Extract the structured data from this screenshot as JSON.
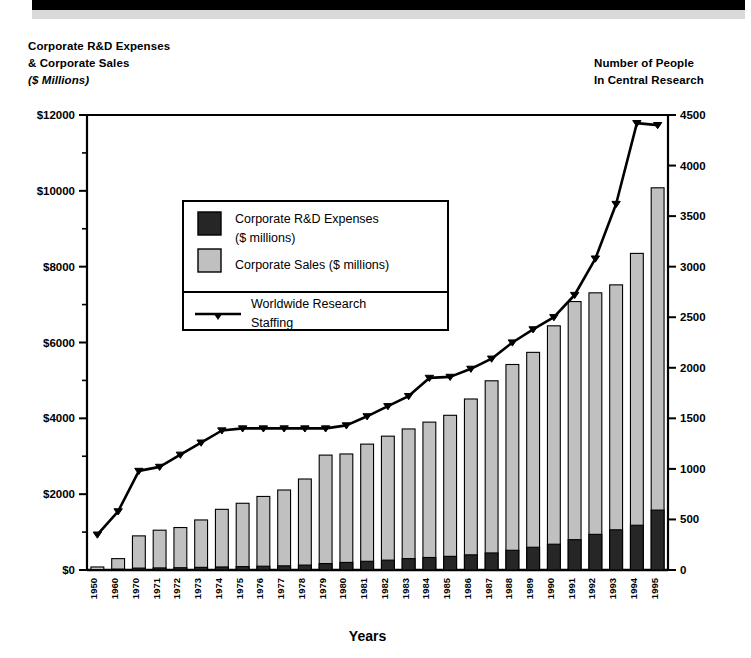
{
  "header": {
    "left_line1": "Corporate R&D Expenses",
    "left_line2": "& Corporate Sales",
    "left_line3": "($ Millions)",
    "right_line1": "Number of People",
    "right_line2": "In Central Research"
  },
  "legend": {
    "item1_line1": "Corporate R&D Expenses",
    "item1_line2": "($ millions)",
    "item2_line1": "Corporate Sales ($ millions)",
    "item3_line1": "Worldwide Research",
    "item3_line2": "Staffing"
  },
  "colors": {
    "rd_bar": "#262626",
    "sales_bar": "#c0c0c0",
    "line": "#000000",
    "axis": "#000000",
    "top_banner": "#000000",
    "top_banner_shadow": "#d9d9d9"
  },
  "chart_data": {
    "type": "bar",
    "title": "",
    "xlabel": "Years",
    "ylabel": "Corporate R&D Expenses & Corporate Sales ($ Millions)",
    "y2label": "Number of People In Central Research",
    "ylim": [
      0,
      12000
    ],
    "y2lim": [
      0,
      4500
    ],
    "yticks": [
      0,
      2000,
      4000,
      6000,
      8000,
      10000,
      12000
    ],
    "ytick_labels": [
      "$0",
      "$2000",
      "$4000",
      "$6000",
      "$8000",
      "$10000",
      "$12000"
    ],
    "yminor_step": 1000,
    "y2ticks": [
      0,
      500,
      1000,
      1500,
      2000,
      2500,
      3000,
      3500,
      4000,
      4500
    ],
    "y2tick_labels": [
      "0",
      "500",
      "1000",
      "1500",
      "2000",
      "2500",
      "3000",
      "3500",
      "4000",
      "4500"
    ],
    "grid": false,
    "legend_position": "upper-left-inside",
    "categories": [
      "1950",
      "1960",
      "1970",
      "1971",
      "1972",
      "1973",
      "1974",
      "1975",
      "1976",
      "1977",
      "1978",
      "1979",
      "1980",
      "1981",
      "1982",
      "1983",
      "1984",
      "1985",
      "1986",
      "1987",
      "1988",
      "1989",
      "1990",
      "1991",
      "1992",
      "1993",
      "1994",
      "1995"
    ],
    "series": [
      {
        "name": "Corporate Sales ($ millions)",
        "type": "bar",
        "axis": "left",
        "values": [
          80,
          300,
          900,
          1050,
          1120,
          1320,
          1600,
          1760,
          1940,
          2110,
          2400,
          3030,
          3060,
          3320,
          3530,
          3720,
          3900,
          4080,
          4510,
          4990,
          5420,
          5740,
          6440,
          7080,
          7310,
          7520,
          8350,
          10080
        ]
      },
      {
        "name": "Corporate R&D Expenses ($ millions)",
        "type": "bar",
        "axis": "left",
        "values": [
          10,
          25,
          50,
          55,
          60,
          70,
          80,
          90,
          100,
          110,
          130,
          170,
          200,
          230,
          260,
          300,
          330,
          360,
          400,
          450,
          520,
          600,
          680,
          800,
          940,
          1060,
          1180,
          1580
        ]
      },
      {
        "name": "Worldwide Research Staffing",
        "type": "line",
        "axis": "right",
        "values": [
          350,
          580,
          980,
          1020,
          1140,
          1260,
          1380,
          1400,
          1400,
          1400,
          1400,
          1400,
          1430,
          1520,
          1620,
          1720,
          1900,
          1910,
          1990,
          2090,
          2250,
          2380,
          2500,
          2720,
          3080,
          3620,
          4420,
          4400
        ]
      }
    ]
  }
}
